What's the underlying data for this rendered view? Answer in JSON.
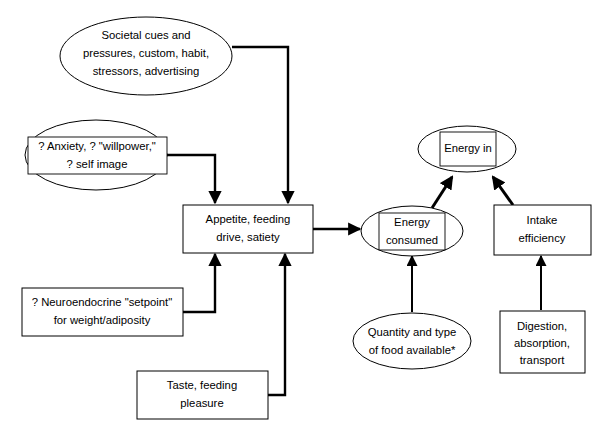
{
  "diagram": {
    "footnote_marker": "*",
    "colors": {
      "stroke": "#000000",
      "fill": "#ffffff",
      "text": "#000000"
    },
    "nodes": [
      {
        "id": "societal-cues",
        "shape": "ellipse-with-text",
        "lines": [
          "Societal cues and",
          "pressures, custom, habit,",
          "stressors, advertising"
        ]
      },
      {
        "id": "anxiety-willpower",
        "shape": "ellipse-with-inner-box",
        "lines": [
          "? Anxiety, ? \"willpower,\"",
          "? self image"
        ]
      },
      {
        "id": "neuroendocrine-setpoint",
        "shape": "rect",
        "lines": [
          "? Neuroendocrine \"setpoint\"",
          "for weight/adiposity"
        ]
      },
      {
        "id": "taste-feeding-pleasure",
        "shape": "rect",
        "lines": [
          "Taste, feeding",
          "pleasure"
        ]
      },
      {
        "id": "appetite-feeding-drive",
        "shape": "rect",
        "lines": [
          "Appetite, feeding",
          "drive, satiety"
        ]
      },
      {
        "id": "energy-consumed",
        "shape": "ellipse-with-inner-box",
        "lines": [
          "Energy",
          "consumed"
        ]
      },
      {
        "id": "energy-in",
        "shape": "ellipse-with-inner-box",
        "lines": [
          "Energy in"
        ]
      },
      {
        "id": "intake-efficiency",
        "shape": "rect",
        "lines": [
          "Intake",
          "efficiency"
        ]
      },
      {
        "id": "quantity-type-food",
        "shape": "ellipse",
        "lines": [
          "Quantity and type",
          "of food available*"
        ]
      },
      {
        "id": "digestion-absorption",
        "shape": "rect",
        "lines": [
          "Digestion,",
          "absorption,",
          "transport"
        ]
      }
    ],
    "edges": [
      {
        "id": "societal-to-appetite",
        "from": "societal-cues",
        "to": "appetite-feeding-drive"
      },
      {
        "id": "anxiety-to-appetite",
        "from": "anxiety-willpower",
        "to": "appetite-feeding-drive"
      },
      {
        "id": "neuroendocrine-to-appetite",
        "from": "neuroendocrine-setpoint",
        "to": "appetite-feeding-drive"
      },
      {
        "id": "taste-to-appetite",
        "from": "taste-feeding-pleasure",
        "to": "appetite-feeding-drive"
      },
      {
        "id": "appetite-to-energy-consumed",
        "from": "appetite-feeding-drive",
        "to": "energy-consumed"
      },
      {
        "id": "energy-consumed-to-energy-in",
        "from": "energy-consumed",
        "to": "energy-in"
      },
      {
        "id": "intake-efficiency-to-energy-in",
        "from": "intake-efficiency",
        "to": "energy-in"
      },
      {
        "id": "quantity-to-energy-consumed",
        "from": "quantity-type-food",
        "to": "energy-consumed"
      },
      {
        "id": "digestion-to-intake-efficiency",
        "from": "digestion-absorption",
        "to": "intake-efficiency"
      }
    ]
  }
}
